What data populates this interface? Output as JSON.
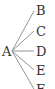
{
  "diagram": {
    "type": "tree",
    "root": {
      "label": "A"
    },
    "children": [
      {
        "label": "B"
      },
      {
        "label": "C"
      },
      {
        "label": "D"
      },
      {
        "label": "E"
      },
      {
        "label": "F"
      }
    ],
    "edge_color": "#888888",
    "text_color": "#333333"
  }
}
